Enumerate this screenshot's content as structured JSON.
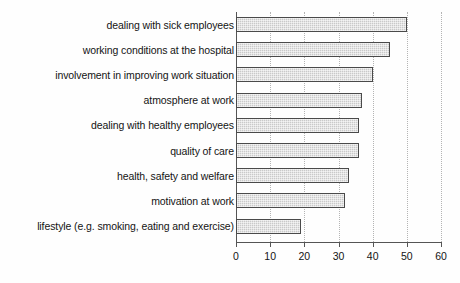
{
  "chart_data": {
    "type": "bar",
    "orientation": "horizontal",
    "title": "",
    "subtitle": "",
    "xlabel": "",
    "ylabel": "",
    "categories": [
      "dealing with sick employees",
      "working conditions at the hospital",
      "involvement in improving work situation",
      "atmosphere at work",
      "dealing with healthy employees",
      "quality of care",
      "health, safety and welfare",
      "motivation at work",
      "lifestyle (e.g. smoking, eating and exercise)"
    ],
    "values": [
      50,
      45,
      40,
      37,
      36,
      36,
      33,
      32,
      19
    ],
    "xlim": [
      0,
      60
    ],
    "xticks": [
      0,
      10,
      20,
      30,
      40,
      50,
      60
    ],
    "xtick_labels": [
      "0",
      "10",
      "20",
      "30",
      "40",
      "50",
      "60"
    ],
    "grid": true,
    "grid_axis": "x",
    "grid_style": "dotted",
    "legend": false,
    "bar_fill": "#c9c9c9",
    "bar_edge": "#4a4a4a",
    "background": "#fefefe"
  }
}
